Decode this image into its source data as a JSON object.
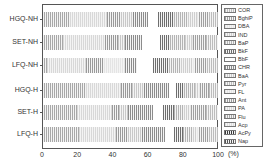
{
  "chart_data": {
    "type": "bar",
    "orientation": "horizontal",
    "stacked": true,
    "title": "",
    "xlabel": "(%)",
    "ylabel": "",
    "xlim": [
      0,
      100
    ],
    "xticks": [
      "0",
      "20",
      "40",
      "60",
      "80",
      "100"
    ],
    "categories": [
      "HGQ-NH",
      "SET-NH",
      "LFQ-NH",
      "HGQ-H",
      "SET-H",
      "LFQ-H"
    ],
    "legend_position": "right",
    "series": [
      {
        "name": "Nap",
        "values": [
          1,
          1,
          1,
          1,
          1,
          1
        ]
      },
      {
        "name": "AcPy",
        "values": [
          0,
          0,
          0,
          0,
          0,
          0
        ]
      },
      {
        "name": "Acp",
        "values": [
          0,
          0,
          0,
          0,
          0,
          0
        ]
      },
      {
        "name": "Flu",
        "values": [
          15,
          11,
          2,
          24,
          19,
          20
        ]
      },
      {
        "name": "PA",
        "values": [
          21,
          24,
          22,
          20,
          20,
          21
        ]
      },
      {
        "name": "Ant",
        "values": [
          8,
          7,
          10,
          6,
          4,
          7
        ]
      },
      {
        "name": "FL",
        "values": [
          0,
          0,
          12,
          0,
          0,
          0
        ]
      },
      {
        "name": "Pyr",
        "values": [
          0,
          0,
          0,
          0,
          0,
          0
        ]
      },
      {
        "name": "BaA",
        "values": [
          7,
          4,
          0,
          7,
          5,
          8
        ]
      },
      {
        "name": "CHR",
        "values": [
          8,
          10,
          7,
          14,
          14,
          13
        ]
      },
      {
        "name": "BbF",
        "values": [
          6,
          10,
          9,
          4,
          6,
          5
        ]
      },
      {
        "name": "BkF",
        "values": [
          9,
          6,
          9,
          5,
          6,
          5
        ]
      },
      {
        "name": "BaP",
        "values": [
          8,
          8,
          7,
          6,
          6,
          6
        ]
      },
      {
        "name": "IND",
        "values": [
          5,
          4,
          7,
          2,
          3,
          2
        ]
      },
      {
        "name": "DBA",
        "values": [
          1,
          1,
          1,
          1,
          1,
          1
        ]
      },
      {
        "name": "BghiP",
        "values": [
          6,
          7,
          7,
          5,
          8,
          6
        ]
      },
      {
        "name": "COR",
        "values": [
          5,
          7,
          6,
          5,
          7,
          5
        ]
      }
    ]
  },
  "legend": [
    "COR",
    "BghiP",
    "DBA",
    "IND",
    "BaP",
    "BkF",
    "BbF",
    "CHR",
    "BaA",
    "Pyr",
    "FL",
    "Ant",
    "PA",
    "Flu",
    "Acp",
    "AcPy",
    "Nap"
  ],
  "colors": {
    "Nap": "#555555",
    "AcPy": "#3a3a3a",
    "Acp": "#dddddd",
    "Flu": "#a8a8a8",
    "PA": "#d8d8d8",
    "Ant": "#9a9a9a",
    "FL": "#e4e4e4",
    "Pyr": "#bdbdbd",
    "BaA": "#c8c8c8",
    "CHR": "#8c8c8c",
    "BbF": "#ffffff",
    "BkF": "#6e6e6e",
    "BaP": "#b4b4b4",
    "IND": "#cfcfcf",
    "DBA": "#e8e8e8",
    "BghiP": "#a0a0a0",
    "COR": "#bcbcbc"
  }
}
